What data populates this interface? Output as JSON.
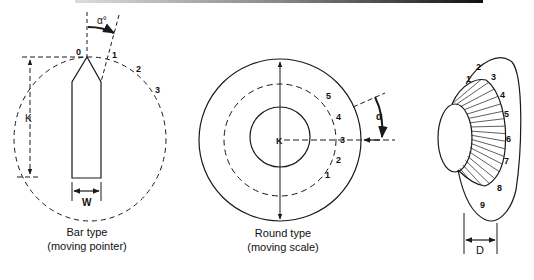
{
  "figures": [
    {
      "id": "bar-type",
      "caption_line1": "Bar type",
      "caption_line2": "(moving pointer)",
      "angle_label": "α°",
      "dimension_height": "K",
      "dimension_width": "W",
      "scale_marks": [
        "0",
        "1",
        "2",
        "3"
      ]
    },
    {
      "id": "round-type",
      "caption_line1": "Round type",
      "caption_line2": "(moving scale)",
      "angle_label": "α",
      "dimension_radius": "K",
      "scale_marks": [
        "1",
        "2",
        "3",
        "4",
        "5"
      ]
    },
    {
      "id": "disc-type",
      "dimension_width": "D",
      "scale_marks": [
        "1",
        "2",
        "3",
        "4",
        "5",
        "6",
        "7",
        "8",
        "9"
      ]
    }
  ],
  "colors": {
    "line": "#1a1a1a",
    "background": "#ffffff"
  }
}
